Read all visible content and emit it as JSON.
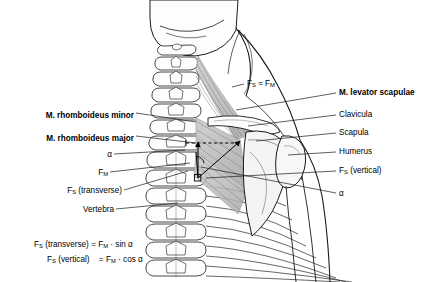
{
  "figure": {
    "type": "anatomical-diagram",
    "background_color": "#ffffff",
    "line_color": "#1a1a1a",
    "muscle_fill": "#b9b9b9"
  },
  "labels_left": [
    {
      "id": "rhomboideus-minor",
      "text": "M. rhomboideus minor",
      "bold": true,
      "x": 134,
      "y": 116,
      "leader_to_x": 196,
      "leader_to_y": 122
    },
    {
      "id": "rhomboideus-major",
      "text": "M. rhomboideus major",
      "bold": true,
      "x": 134,
      "y": 139,
      "leader_to_x": 196,
      "leader_to_y": 143
    },
    {
      "id": "alpha-left",
      "text": "α",
      "bold": false,
      "x": 134,
      "y": 157,
      "leader_to_x": 185,
      "leader_to_y": 150
    },
    {
      "id": "f-m",
      "text": "F",
      "subscript": "M",
      "bold": false,
      "x": 134,
      "y": 175,
      "leader_to_x": 190,
      "leader_to_y": 163
    },
    {
      "id": "f-s-transverse",
      "text": "F",
      "subscript": "S",
      "suffix": " (transverse)",
      "bold": false,
      "x": 134,
      "y": 193,
      "leader_to_x": 188,
      "leader_to_y": 171
    },
    {
      "id": "vertebra",
      "text": "Vertebra",
      "bold": false,
      "x": 134,
      "y": 212,
      "leader_to_x": 178,
      "leader_to_y": 203
    }
  ],
  "labels_right": [
    {
      "id": "f-s-approx-f-m",
      "text": "F",
      "subscript": "S",
      "suffix": " ≈ F",
      "subscript2": "M",
      "bold": false,
      "x": 246,
      "y": 86,
      "leader_to_x": 233,
      "leader_to_y": 88
    },
    {
      "id": "levator-scapulae",
      "text": "M. levator scapulae",
      "bold": true,
      "x": 338,
      "y": 96,
      "leader_to_x": 236,
      "leader_to_y": 110
    },
    {
      "id": "clavicula",
      "text": "Clavicula",
      "bold": false,
      "x": 338,
      "y": 118,
      "leader_to_x": 248,
      "leader_to_y": 126
    },
    {
      "id": "scapula",
      "text": "Scapula",
      "bold": false,
      "x": 338,
      "y": 136,
      "leader_to_x": 256,
      "leader_to_y": 141
    },
    {
      "id": "humerus",
      "text": "Humerus",
      "bold": false,
      "x": 338,
      "y": 155,
      "leader_to_x": 288,
      "leader_to_y": 155
    },
    {
      "id": "f-s-vertical",
      "text": "F",
      "subscript": "S",
      "suffix": " (vertical)",
      "bold": false,
      "x": 338,
      "y": 174,
      "leader_to_x": 205,
      "leader_to_y": 178
    },
    {
      "id": "alpha-right",
      "text": "α",
      "bold": false,
      "x": 338,
      "y": 196,
      "leader_to_x": 200,
      "leader_to_y": 168
    }
  ],
  "formulas": [
    {
      "id": "formula-transverse",
      "lhs_sym": "F",
      "lhs_sub": "S",
      "lhs_rest": " (transverse)",
      "eq": "=",
      "rhs_sym": "F",
      "rhs_sub": "M",
      "rhs_rest": " · sin α"
    },
    {
      "id": "formula-vertical",
      "lhs_sym": "F",
      "lhs_sub": "S",
      "lhs_rest": " (vertical)",
      "eq": "=",
      "rhs_sym": "F",
      "rhs_sub": "M",
      "rhs_rest": " · cos α"
    }
  ]
}
